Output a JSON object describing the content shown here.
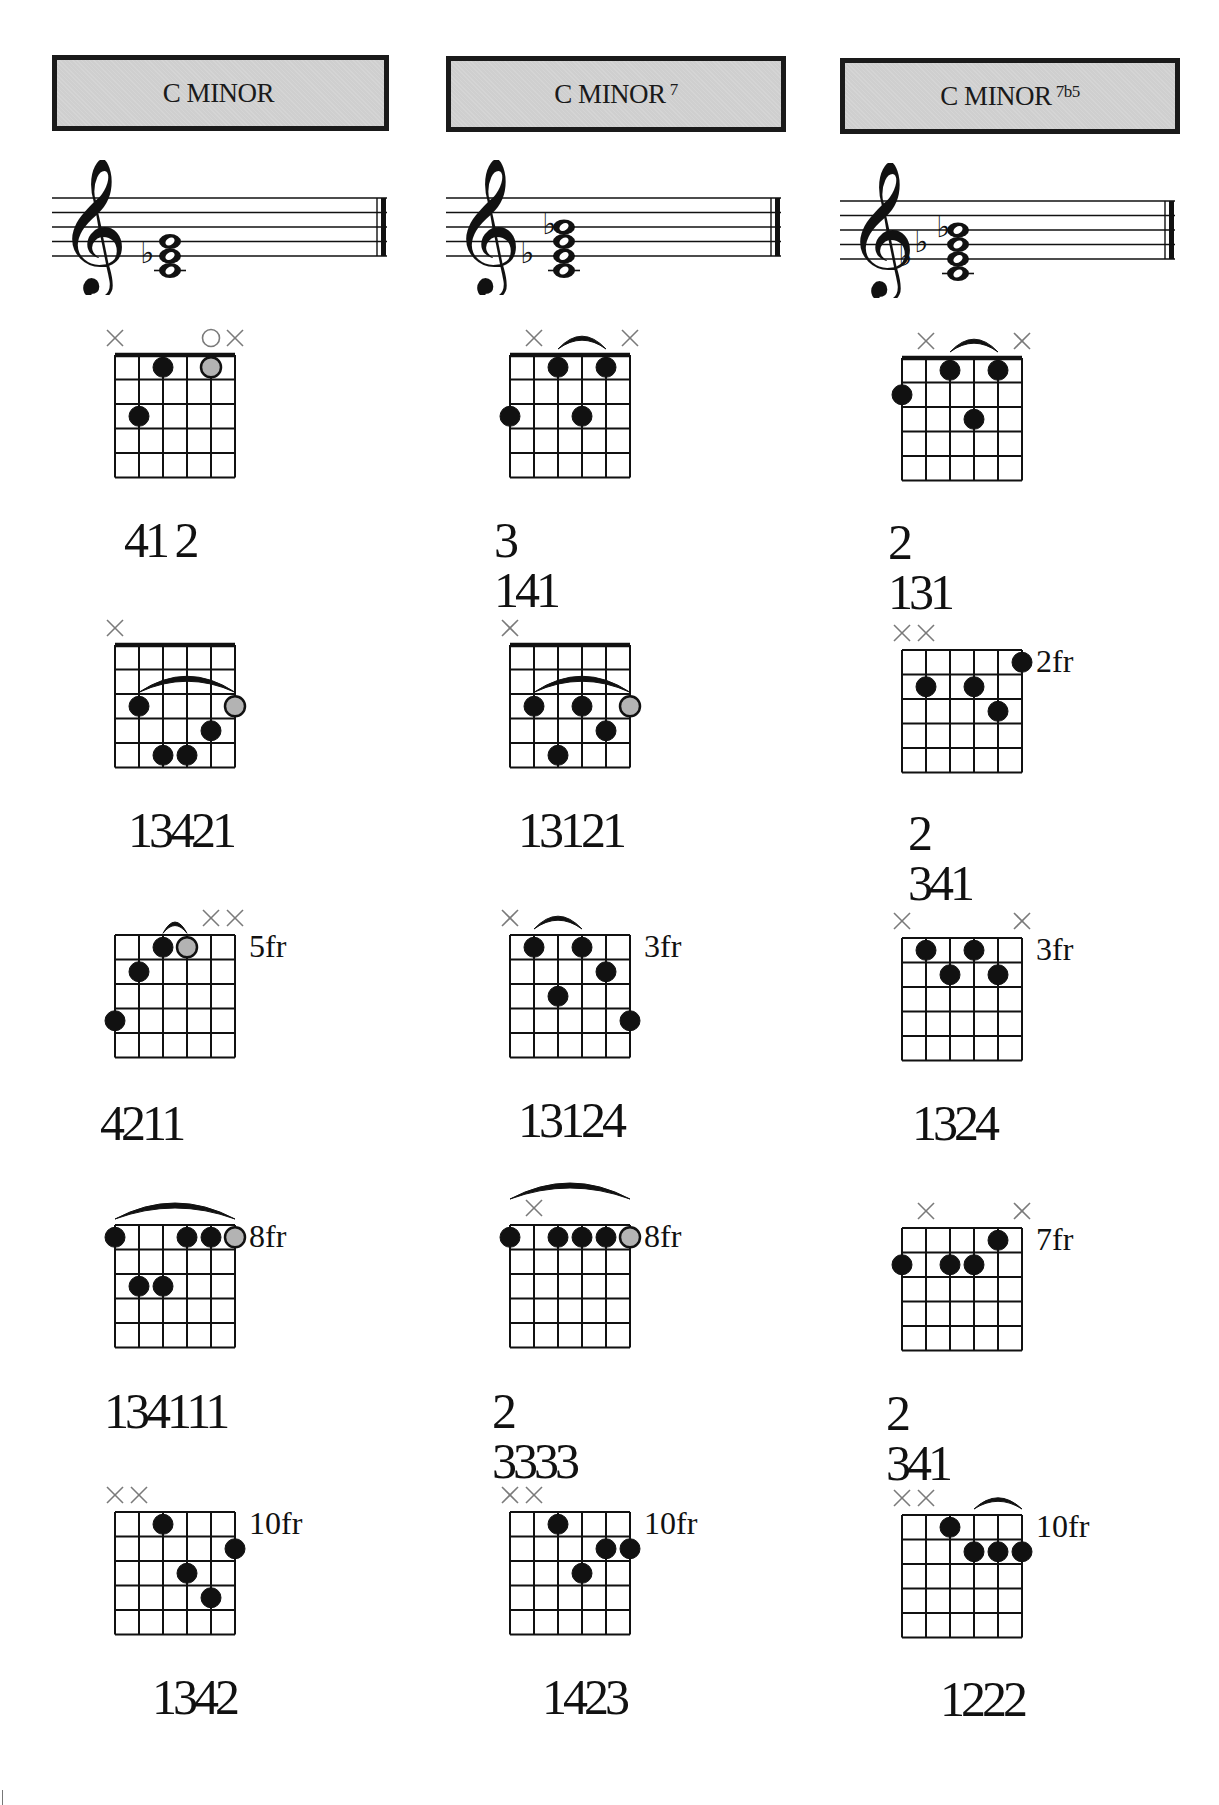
{
  "page": {
    "columns": [
      {
        "title": "C MINOR",
        "superscript": "",
        "staff": {
          "accidentals": [
            "flat-E"
          ],
          "notes": [
            "C4",
            "Eb4",
            "G4"
          ]
        },
        "diagrams": [
          {
            "fret_label": "",
            "muted": [
              0,
              5
            ],
            "open": [
              4
            ],
            "dots": [
              {
                "s": 2,
                "f": 1
              },
              {
                "s": 1,
                "f": 3
              },
              {
                "s": 4,
                "f": 1,
                "root": true
              }
            ],
            "barres": [],
            "fingering": "41 2"
          },
          {
            "fret_label": "",
            "muted": [
              0
            ],
            "open": [],
            "dots": [
              {
                "s": 1,
                "f": 3
              },
              {
                "s": 2,
                "f": 5
              },
              {
                "s": 3,
                "f": 5
              },
              {
                "s": 4,
                "f": 4
              },
              {
                "s": 5,
                "f": 3,
                "root": true
              }
            ],
            "barres": [
              {
                "from": 1,
                "to": 5,
                "f": 3
              }
            ],
            "fingering": "13421"
          },
          {
            "fret_label": "5fr",
            "muted": [
              4,
              5
            ],
            "open": [],
            "dots": [
              {
                "s": 0,
                "f": 4
              },
              {
                "s": 1,
                "f": 2
              },
              {
                "s": 2,
                "f": 1
              },
              {
                "s": 3,
                "f": 1,
                "root": true
              }
            ],
            "barres": [
              {
                "from": 2,
                "to": 3,
                "f": 1,
                "small": true
              }
            ],
            "fingering": "4211"
          },
          {
            "fret_label": "8fr",
            "muted": [],
            "open": [],
            "dots": [
              {
                "s": 0,
                "f": 1
              },
              {
                "s": 1,
                "f": 3
              },
              {
                "s": 2,
                "f": 3
              },
              {
                "s": 3,
                "f": 1
              },
              {
                "s": 4,
                "f": 1
              },
              {
                "s": 5,
                "f": 1,
                "root": true
              }
            ],
            "barres": [
              {
                "from": 0,
                "to": 5,
                "f": 1,
                "high": true
              }
            ],
            "fingering": "134111"
          },
          {
            "fret_label": "10fr",
            "muted": [
              0,
              1
            ],
            "open": [],
            "dots": [
              {
                "s": 2,
                "f": 1
              },
              {
                "s": 3,
                "f": 3
              },
              {
                "s": 4,
                "f": 4
              },
              {
                "s": 5,
                "f": 2
              }
            ],
            "barres": [],
            "fingering": "1342"
          }
        ]
      },
      {
        "title": "C MINOR",
        "superscript": "7",
        "staff": {
          "accidentals": [
            "flat-E",
            "flat-B"
          ],
          "notes": [
            "C4",
            "Eb4",
            "G4",
            "Bb4"
          ]
        },
        "diagrams": [
          {
            "fret_label": "",
            "muted": [
              1,
              5
            ],
            "open": [],
            "dots": [
              {
                "s": 0,
                "f": 3
              },
              {
                "s": 2,
                "f": 1
              },
              {
                "s": 3,
                "f": 3
              },
              {
                "s": 4,
                "f": 1
              }
            ],
            "barres": [
              {
                "from": 2,
                "to": 4,
                "f": 1,
                "high": true
              }
            ],
            "fingering": "3 141"
          },
          {
            "fret_label": "",
            "muted": [
              0
            ],
            "open": [],
            "dots": [
              {
                "s": 1,
                "f": 3
              },
              {
                "s": 2,
                "f": 5
              },
              {
                "s": 3,
                "f": 3
              },
              {
                "s": 4,
                "f": 4
              },
              {
                "s": 5,
                "f": 3,
                "root": true
              }
            ],
            "barres": [
              {
                "from": 1,
                "to": 5,
                "f": 3
              }
            ],
            "fingering": "13121"
          },
          {
            "fret_label": "3fr",
            "muted": [
              0
            ],
            "open": [],
            "dots": [
              {
                "s": 1,
                "f": 1
              },
              {
                "s": 2,
                "f": 3
              },
              {
                "s": 3,
                "f": 1
              },
              {
                "s": 4,
                "f": 2
              },
              {
                "s": 5,
                "f": 4
              }
            ],
            "barres": [
              {
                "from": 1,
                "to": 3,
                "f": 1,
                "high": true
              }
            ],
            "fingering": "13124"
          },
          {
            "fret_label": "8fr",
            "muted": [
              1
            ],
            "open": [],
            "dots": [
              {
                "s": 0,
                "f": 1
              },
              {
                "s": 2,
                "f": 1
              },
              {
                "s": 3,
                "f": 1
              },
              {
                "s": 4,
                "f": 1
              },
              {
                "s": 5,
                "f": 1,
                "root": true
              }
            ],
            "barres": [
              {
                "from": 0,
                "to": 5,
                "f": 1,
                "high": true,
                "extra": true
              }
            ],
            "fingering": "2 3333"
          },
          {
            "fret_label": "10fr",
            "muted": [
              0,
              1
            ],
            "open": [],
            "dots": [
              {
                "s": 2,
                "f": 1
              },
              {
                "s": 3,
                "f": 3
              },
              {
                "s": 4,
                "f": 2
              },
              {
                "s": 5,
                "f": 2
              }
            ],
            "barres": [],
            "fingering": "1423"
          }
        ]
      },
      {
        "title": "C MINOR",
        "superscript": "7b5",
        "staff": {
          "accidentals": [
            "flat-E",
            "flat-G",
            "flat-B"
          ],
          "notes": [
            "C4",
            "Eb4",
            "Gb4",
            "Bb4"
          ]
        },
        "diagrams": [
          {
            "fret_label": "",
            "muted": [
              1,
              5
            ],
            "open": [],
            "dots": [
              {
                "s": 0,
                "f": 2
              },
              {
                "s": 2,
                "f": 1
              },
              {
                "s": 3,
                "f": 3
              },
              {
                "s": 4,
                "f": 1
              }
            ],
            "barres": [
              {
                "from": 2,
                "to": 4,
                "f": 1,
                "high": true
              }
            ],
            "fingering": "2 131"
          },
          {
            "fret_label": "2fr",
            "muted": [
              0,
              1
            ],
            "open": [],
            "dots": [
              {
                "s": 1,
                "f": 2
              },
              {
                "s": 3,
                "f": 2
              },
              {
                "s": 4,
                "f": 3
              },
              {
                "s": 5,
                "f": 1
              }
            ],
            "barres": [],
            "fingering": "2 341"
          },
          {
            "fret_label": "3fr",
            "muted": [
              0,
              5
            ],
            "open": [],
            "dots": [
              {
                "s": 1,
                "f": 1
              },
              {
                "s": 2,
                "f": 2
              },
              {
                "s": 3,
                "f": 1
              },
              {
                "s": 4,
                "f": 2
              }
            ],
            "barres": [],
            "fingering": "1324"
          },
          {
            "fret_label": "7fr",
            "muted": [
              1,
              5
            ],
            "open": [],
            "dots": [
              {
                "s": 0,
                "f": 2
              },
              {
                "s": 2,
                "f": 2
              },
              {
                "s": 3,
                "f": 2
              },
              {
                "s": 4,
                "f": 1
              }
            ],
            "barres": [],
            "fingering": "2 341"
          },
          {
            "fret_label": "10fr",
            "muted": [
              0,
              1
            ],
            "open": [],
            "dots": [
              {
                "s": 2,
                "f": 1
              },
              {
                "s": 3,
                "f": 2
              },
              {
                "s": 4,
                "f": 2
              },
              {
                "s": 5,
                "f": 2
              }
            ],
            "barres": [
              {
                "from": 3,
                "to": 5,
                "f": 2,
                "high": true,
                "small": true
              }
            ],
            "fingering": "1222"
          }
        ]
      }
    ]
  },
  "colors": {
    "ink": "#111111",
    "header_fill": "#cfcfcf",
    "root_dot": "#b3b3b3",
    "mute_mark": "#7a7a7a"
  }
}
